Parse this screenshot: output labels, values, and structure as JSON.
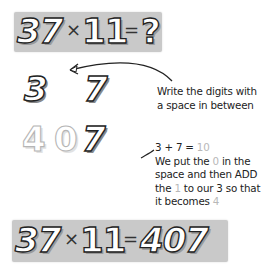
{
  "top_equation": {
    "left": "37",
    "operator": "×",
    "right": "11",
    "equals": "=",
    "result": "?"
  },
  "step1": {
    "digit_a": "3",
    "digit_b": "7",
    "note_line1": "Write the digits with",
    "note_line2": "a space in between"
  },
  "step2": {
    "digit_1": "4",
    "digit_2": "0",
    "digit_3": "7",
    "sum_prefix": "3 + 7 = ",
    "sum_value": "10",
    "line2_a": "We put the ",
    "line2_zero": "0",
    "line2_b": " in the",
    "line3": "space and then ADD",
    "line4_a": "the ",
    "line4_one": "1",
    "line4_b": " to our 3 so that",
    "line5_a": "it becomes ",
    "line5_four": "4"
  },
  "bottom_equation": {
    "left": "37",
    "operator": "×",
    "right": "11",
    "equals": "=",
    "result": "407"
  },
  "colors": {
    "banner": "#c9c9c9",
    "highlight": "#b8b8b8",
    "ink": "#222222"
  }
}
